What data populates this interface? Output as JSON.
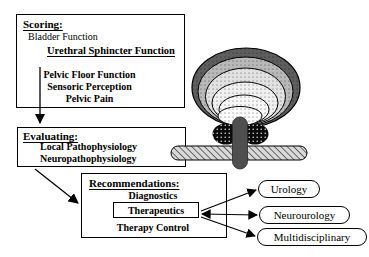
{
  "figure": {
    "scoring": {
      "title": "Scoring:",
      "items": [
        "Bladder Function",
        "Urethral Sphincter Function",
        "Pelvic Floor Function",
        "Sensoric Perception",
        "Pelvic Pain"
      ]
    },
    "evaluating": {
      "title": "Evaluating:",
      "items": [
        "Local Pathophysiology",
        "Neuropathophysiology"
      ]
    },
    "recommendations": {
      "title": "Recommendations:",
      "diagnostics": "Diagnostics",
      "therapeutics": "Therapeutics",
      "therapy_control": "Therapy Control"
    },
    "specialties": [
      {
        "label": "Urology"
      },
      {
        "label": "Neurourology"
      },
      {
        "label": "Multidisciplinary"
      }
    ]
  },
  "colors": {
    "background": "#ffffff",
    "line": "#000000",
    "text": "#000000",
    "funnel_outer_ring": "#5e5e5e",
    "funnel_ring2": "#b9b9b9",
    "funnel_ring3": "#e2e2e2",
    "funnel_ring4": "#f0f0f0",
    "funnel_ring5": "#f7f7f7",
    "funnel_center": "#fdfdfd",
    "sphincter": "#0a0a0a",
    "urethra_tube": "#4f4f4f",
    "pelvic_floor_bar": "#d9d9d9"
  }
}
